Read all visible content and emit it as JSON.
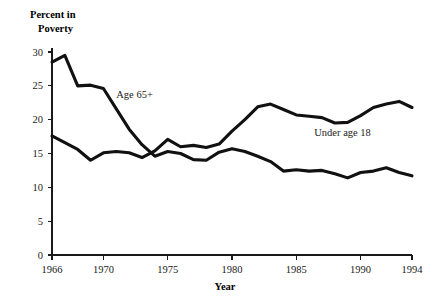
{
  "chart_data": {
    "type": "line",
    "title": "",
    "ylabel": "Percent in Poverty",
    "ylabel_line1": "Percent in",
    "ylabel_line2": "Poverty",
    "xlabel": "Year",
    "xlim": [
      1966,
      1994
    ],
    "ylim": [
      0,
      30
    ],
    "grid": false,
    "legend_position": "inline-annotations",
    "xticks": [
      1966,
      1970,
      1975,
      1980,
      1985,
      1990,
      1994
    ],
    "xticklabels": [
      "1966",
      "1970",
      "1975",
      "1980",
      "1985",
      "1990",
      "1994"
    ],
    "yticks": [
      0,
      5,
      10,
      15,
      20,
      25,
      30
    ],
    "yticklabels": [
      "0",
      "5",
      "10",
      "15",
      "20",
      "25",
      "30"
    ],
    "x": [
      1966,
      1967,
      1968,
      1969,
      1970,
      1971,
      1972,
      1973,
      1974,
      1975,
      1976,
      1977,
      1978,
      1979,
      1980,
      1981,
      1982,
      1983,
      1984,
      1985,
      1986,
      1987,
      1988,
      1989,
      1990,
      1991,
      1992,
      1993,
      1994
    ],
    "series": [
      {
        "name": "Age 65+",
        "label": "Age 65+",
        "label_x": 1971.0,
        "label_y": 23.2,
        "values": [
          28.5,
          29.5,
          25.0,
          25.1,
          24.6,
          21.6,
          18.6,
          16.3,
          14.6,
          15.3,
          15.0,
          14.1,
          14.0,
          15.2,
          15.7,
          15.3,
          14.6,
          13.8,
          12.4,
          12.6,
          12.4,
          12.5,
          12.0,
          11.4,
          12.2,
          12.4,
          12.9,
          12.2,
          11.7
        ]
      },
      {
        "name": "Under age 18",
        "label": "Under age 18",
        "label_x": 1986.4,
        "label_y": 17.6,
        "values": [
          17.6,
          16.6,
          15.6,
          14.0,
          15.1,
          15.3,
          15.1,
          14.4,
          15.4,
          17.1,
          16.0,
          16.2,
          15.9,
          16.4,
          18.3,
          20.0,
          21.9,
          22.3,
          21.5,
          20.7,
          20.5,
          20.3,
          19.5,
          19.6,
          20.6,
          21.8,
          22.3,
          22.7,
          21.8
        ]
      }
    ]
  },
  "geometry": {
    "plot_left": 52,
    "plot_right": 412,
    "plot_bottom": 255,
    "plot_top": 52,
    "ylabel_x": 30,
    "ylabel_y1": 18,
    "ylabel_y2": 32,
    "xlabel_x": 225,
    "xlabel_y": 290
  }
}
